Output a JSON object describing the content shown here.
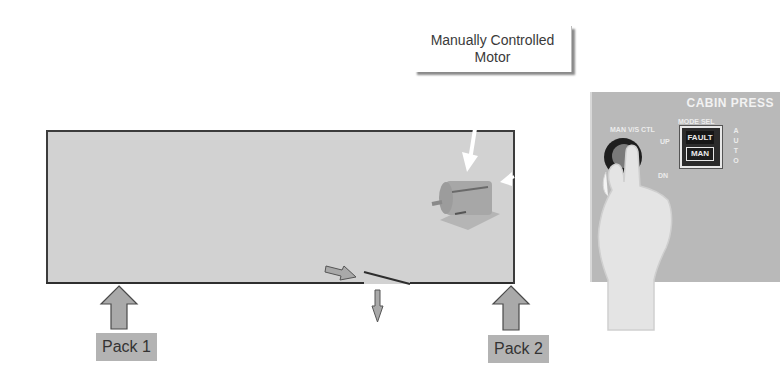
{
  "callout": {
    "line1": "Manually Controlled",
    "line2": "Motor"
  },
  "fuselage": {
    "fill": "#d2d2d2",
    "outline": "#3c3c3c"
  },
  "packs": [
    {
      "label": "Pack 1"
    },
    {
      "label": "Pack 2"
    }
  ],
  "panel": {
    "title": "CABIN PRESS",
    "knob_label": "MAN V/S CTL",
    "knob_up": "UP",
    "knob_dn": "DN",
    "mode_label": "MODE SEL",
    "fault": "FAULT",
    "man": "MAN",
    "auto_letters": [
      "A",
      "U",
      "T",
      "O"
    ]
  },
  "colors": {
    "arrow_fill": "#a9a9a9",
    "arrow_stroke": "#4a4a4a",
    "label_bg": "#b3b3b3"
  }
}
